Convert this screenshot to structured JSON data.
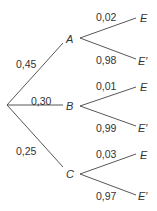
{
  "diagram": {
    "type": "probability-tree",
    "root": "",
    "first_level": [
      {
        "node": "A",
        "prob": "0,45",
        "children": [
          {
            "node": "E",
            "prob": "0,02"
          },
          {
            "node": "E′",
            "prob": "0,98"
          }
        ]
      },
      {
        "node": "B",
        "prob": "0,30",
        "children": [
          {
            "node": "E",
            "prob": "0,01"
          },
          {
            "node": "E′",
            "prob": "0,99"
          }
        ]
      },
      {
        "node": "C",
        "prob": "0,25",
        "children": [
          {
            "node": "E",
            "prob": "0,03"
          },
          {
            "node": "E′",
            "prob": "0,97"
          }
        ]
      }
    ]
  }
}
